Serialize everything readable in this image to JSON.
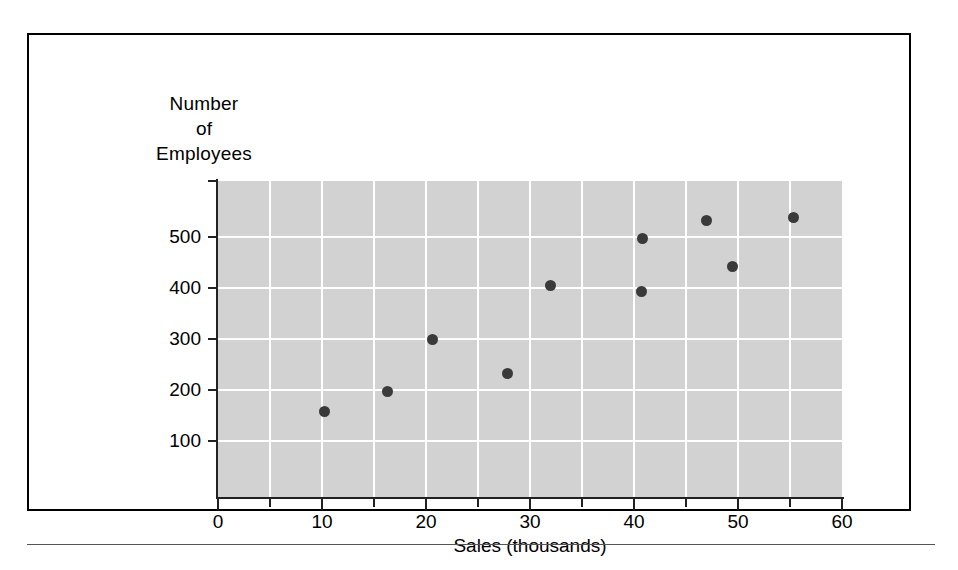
{
  "figure": {
    "background_color": "#ffffff",
    "frame_border_color": "#000000",
    "plot_background_color": "#d2d2d2",
    "gridline_color": "#ffffff",
    "marker_color": "#3a3a3a",
    "axis_color": "#222222"
  },
  "axis_titles": {
    "y_line1": "Number",
    "y_line2": "of",
    "y_line3": "Employees",
    "x": "Sales (thousands)"
  },
  "chart_data": {
    "type": "scatter",
    "title": "",
    "xlabel": "Sales (thousands)",
    "ylabel": "Number of Employees",
    "xlim": [
      0,
      60
    ],
    "ylim": [
      -10,
      610
    ],
    "grid": true,
    "legend": null,
    "x_ticks": [
      0,
      10,
      20,
      30,
      40,
      50,
      60
    ],
    "x_tick_labels": [
      "0",
      "10",
      "20",
      "30",
      "40",
      "50",
      "60"
    ],
    "x_minor_ticks": [
      5,
      15,
      25,
      35,
      45,
      55
    ],
    "y_ticks": [
      100,
      200,
      300,
      400,
      500
    ],
    "y_tick_labels": [
      "100",
      "200",
      "300",
      "400",
      "500"
    ],
    "x_gridlines": [
      5,
      10,
      15,
      20,
      25,
      30,
      35,
      40,
      45,
      50,
      55
    ],
    "y_gridlines": [
      100,
      200,
      300,
      400,
      500
    ],
    "points": [
      {
        "x": 10.2,
        "y": 158
      },
      {
        "x": 16.3,
        "y": 197
      },
      {
        "x": 20.6,
        "y": 300
      },
      {
        "x": 27.8,
        "y": 233
      },
      {
        "x": 32.0,
        "y": 405
      },
      {
        "x": 40.8,
        "y": 497
      },
      {
        "x": 40.7,
        "y": 393
      },
      {
        "x": 47.0,
        "y": 533
      },
      {
        "x": 49.5,
        "y": 443
      },
      {
        "x": 55.3,
        "y": 539
      }
    ]
  }
}
